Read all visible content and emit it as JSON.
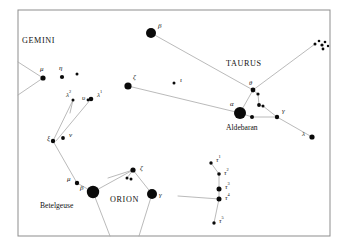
{
  "figure": {
    "kind": "star-chart",
    "background_color": "#ffffff",
    "frame_color": "#8d8d8d",
    "star_color": "#0a0a0a",
    "line_color": "#a8a8a8",
    "label_color": "#111111",
    "frame": {
      "x": 18,
      "y": 10,
      "width": 312,
      "height": 226
    }
  },
  "chart_data": {
    "type": "scatter",
    "title": "",
    "xlabel": "",
    "ylabel": "",
    "xlim": [
      0,
      343
    ],
    "ylim": [
      0,
      246
    ],
    "grid": false,
    "legend": "none",
    "constellation_names": [
      {
        "id": "gemini",
        "text": "GEMINI",
        "x": 22,
        "y": 43,
        "font_size": 8.2
      },
      {
        "id": "taurus",
        "text": "TAURUS",
        "x": 226,
        "y": 66,
        "font_size": 8.2
      },
      {
        "id": "orion",
        "text": "ORION",
        "x": 110,
        "y": 202,
        "font_size": 8.2
      }
    ],
    "proper_names": [
      {
        "id": "aldebaran",
        "text": "Aldebaran",
        "x": 226,
        "y": 130,
        "font_size": 7.6
      },
      {
        "id": "betelgeuse",
        "text": "Betelgeuse",
        "x": 40,
        "y": 208,
        "font_size": 7.6
      }
    ],
    "stars": [
      {
        "id": "beta-tau",
        "label": "β",
        "sup": "",
        "x": 151,
        "y": 33,
        "r": 5.0,
        "lx": 158,
        "ly": 28,
        "fs": 7.0
      },
      {
        "id": "zeta-tau",
        "label": "ζ",
        "sup": "",
        "x": 128,
        "y": 86,
        "r": 3.6,
        "lx": 133,
        "ly": 79,
        "fs": 7.0
      },
      {
        "id": "iota-tau",
        "label": "ι",
        "sup": "",
        "x": 174,
        "y": 83,
        "r": 1.5,
        "lx": 180,
        "ly": 82,
        "fs": 7.0
      },
      {
        "id": "alpha-tau",
        "label": "α",
        "sup": "",
        "x": 240,
        "y": 113,
        "r": 6.0,
        "lx": 230,
        "ly": 106,
        "fs": 7.0
      },
      {
        "id": "theta-tau",
        "label": "θ",
        "sup": "",
        "x": 253,
        "y": 90,
        "r": 2.4,
        "lx": 249,
        "ly": 85,
        "fs": 6.6
      },
      {
        "id": "theta2-tau",
        "label": "",
        "sup": "",
        "x": 258,
        "y": 94,
        "r": 1.6,
        "lx": 0,
        "ly": 0,
        "fs": 6.0
      },
      {
        "id": "delta-tau",
        "label": "",
        "sup": "",
        "x": 259,
        "y": 105,
        "r": 1.9,
        "lx": 0,
        "ly": 0,
        "fs": 6.0
      },
      {
        "id": "delta2-tau",
        "label": "",
        "sup": "",
        "x": 263,
        "y": 106,
        "r": 1.5,
        "lx": 0,
        "ly": 0,
        "fs": 6.0
      },
      {
        "id": "eps-tau",
        "label": "",
        "sup": "",
        "x": 252,
        "y": 117,
        "r": 2.0,
        "lx": 0,
        "ly": 0,
        "fs": 6.0
      },
      {
        "id": "gamma-tau",
        "label": "γ",
        "sup": "",
        "x": 277,
        "y": 117,
        "r": 2.2,
        "lx": 282,
        "ly": 113,
        "fs": 7.0
      },
      {
        "id": "lambda-tau",
        "label": "λ",
        "sup": "",
        "x": 312,
        "y": 137,
        "r": 2.6,
        "lx": 302,
        "ly": 136,
        "fs": 7.0
      },
      {
        "id": "pleiades-1",
        "label": "",
        "sup": "",
        "x": 315,
        "y": 44,
        "r": 1.5,
        "lx": 0,
        "ly": 0,
        "fs": 6.0
      },
      {
        "id": "pleiades-2",
        "label": "",
        "sup": "",
        "x": 319,
        "y": 41,
        "r": 1.3,
        "lx": 0,
        "ly": 0,
        "fs": 6.0
      },
      {
        "id": "pleiades-3",
        "label": "",
        "sup": "",
        "x": 322,
        "y": 45,
        "r": 1.6,
        "lx": 0,
        "ly": 0,
        "fs": 6.0
      },
      {
        "id": "pleiades-4",
        "label": "",
        "sup": "",
        "x": 325,
        "y": 42,
        "r": 1.3,
        "lx": 0,
        "ly": 0,
        "fs": 6.0
      },
      {
        "id": "pleiades-5",
        "label": "",
        "sup": "",
        "x": 323,
        "y": 49,
        "r": 1.4,
        "lx": 0,
        "ly": 0,
        "fs": 6.0
      },
      {
        "id": "pleiades-6",
        "label": "",
        "sup": "",
        "x": 328,
        "y": 46,
        "r": 1.2,
        "lx": 0,
        "ly": 0,
        "fs": 6.0
      },
      {
        "id": "mu-gem",
        "label": "μ",
        "sup": "",
        "x": 43,
        "y": 78,
        "r": 2.6,
        "lx": 40,
        "ly": 71,
        "fs": 7.0
      },
      {
        "id": "eta-gem",
        "label": "η",
        "sup": "",
        "x": 62,
        "y": 77,
        "r": 2.1,
        "lx": 59,
        "ly": 70,
        "fs": 7.0
      },
      {
        "id": "nu-gem",
        "label": "",
        "sup": "",
        "x": 77,
        "y": 74,
        "r": 1.5,
        "lx": 0,
        "ly": 0,
        "fs": 6.0
      },
      {
        "id": "lambda2-ori",
        "label": "λ",
        "sup": "2",
        "x": 73,
        "y": 100,
        "r": 1.5,
        "lx": 66,
        "ly": 97,
        "fs": 7.0
      },
      {
        "id": "ups-ori",
        "label": "υ",
        "sup": "",
        "x": 88,
        "y": 100,
        "r": 1.4,
        "lx": 82,
        "ly": 100,
        "fs": 7.0
      },
      {
        "id": "lambda1-ori",
        "label": "λ",
        "sup": "1",
        "x": 91,
        "y": 99,
        "r": 2.3,
        "lx": 97,
        "ly": 97,
        "fs": 7.0
      },
      {
        "id": "xi-ori",
        "label": "ξ",
        "sup": "",
        "x": 53,
        "y": 141,
        "r": 2.2,
        "lx": 47,
        "ly": 140,
        "fs": 7.0
      },
      {
        "id": "nu-ori",
        "label": "ν",
        "sup": "",
        "x": 63,
        "y": 138,
        "r": 1.9,
        "lx": 69,
        "ly": 137,
        "fs": 7.0
      },
      {
        "id": "mu-ori",
        "label": "μ",
        "sup": "",
        "x": 77,
        "y": 183,
        "r": 2.2,
        "lx": 67,
        "ly": 181,
        "fs": 7.0
      },
      {
        "id": "alpha-ori",
        "label": "β",
        "sup": "",
        "x": 93,
        "y": 192,
        "r": 6.2,
        "lx": 80,
        "ly": 190,
        "fs": 7.0
      },
      {
        "id": "chi-ori",
        "label": "ζ",
        "sup": "",
        "x": 133,
        "y": 170,
        "r": 2.6,
        "lx": 140,
        "ly": 170,
        "fs": 7.0
      },
      {
        "id": "chi2-ori",
        "label": "",
        "sup": "",
        "x": 127,
        "y": 178,
        "r": 1.5,
        "lx": 0,
        "ly": 0,
        "fs": 6.0
      },
      {
        "id": "chi3-ori",
        "label": "",
        "sup": "",
        "x": 131,
        "y": 179,
        "r": 1.5,
        "lx": 0,
        "ly": 0,
        "fs": 6.0
      },
      {
        "id": "gamma-ori",
        "label": "γ",
        "sup": "",
        "x": 152,
        "y": 194,
        "r": 5.0,
        "lx": 159,
        "ly": 197,
        "fs": 7.0
      },
      {
        "id": "tau1",
        "label": "τ",
        "sup": "1",
        "x": 211,
        "y": 163,
        "r": 1.7,
        "lx": 216,
        "ly": 162,
        "fs": 7.0
      },
      {
        "id": "tau2",
        "label": "τ",
        "sup": "2",
        "x": 219,
        "y": 174,
        "r": 1.8,
        "lx": 224,
        "ly": 175,
        "fs": 7.0
      },
      {
        "id": "tau3",
        "label": "τ",
        "sup": "3",
        "x": 219,
        "y": 189,
        "r": 2.5,
        "lx": 225,
        "ly": 189,
        "fs": 7.0
      },
      {
        "id": "tau4",
        "label": "τ",
        "sup": "4",
        "x": 219,
        "y": 199,
        "r": 2.5,
        "lx": 225,
        "ly": 200,
        "fs": 7.0
      },
      {
        "id": "tau5",
        "label": "τ",
        "sup": "5",
        "x": 214,
        "y": 223,
        "r": 1.7,
        "lx": 219,
        "ly": 223,
        "fs": 7.0
      }
    ],
    "lines": [
      {
        "id": "beta-to-theta",
        "points": "151,33 253,90"
      },
      {
        "id": "zeta-to-alpha",
        "points": "128,86 240,113"
      },
      {
        "id": "theta-to-alpha",
        "points": "253,90 240,113"
      },
      {
        "id": "theta-to-pleiades",
        "points": "253,90 315,44"
      },
      {
        "id": "theta2-chain",
        "points": "253,90 258,94 259,105 263,106"
      },
      {
        "id": "alpha-to-eps",
        "points": "240,113 252,117"
      },
      {
        "id": "eps-to-gamma",
        "points": "252,117 277,117"
      },
      {
        "id": "gamma-to-lambda",
        "points": "277,117 312,137"
      },
      {
        "id": "delta-to-gamma",
        "points": "263,106 277,117"
      },
      {
        "id": "gemini-left-upper",
        "points": "18,62 43,78"
      },
      {
        "id": "gemini-left-lower",
        "points": "18,95 43,78"
      },
      {
        "id": "lambda2-to-xi",
        "points": "73,100 53,141"
      },
      {
        "id": "lambda1-to-xi",
        "points": "91,99 56,141"
      },
      {
        "id": "lambda2-down",
        "points": "73,100 70,113"
      },
      {
        "id": "xi-to-mu",
        "points": "53,141 77,183"
      },
      {
        "id": "mu-to-betelgeuse",
        "points": "77,183 93,192"
      },
      {
        "id": "betelgeuse-to-chi",
        "points": "93,192 133,170"
      },
      {
        "id": "chi-to-gamma",
        "points": "133,170 152,194"
      },
      {
        "id": "chi2-to-betelgeuse",
        "points": "127,178 133,170"
      },
      {
        "id": "betelgeuse-down",
        "points": "93,192 110,236"
      },
      {
        "id": "gamma-down",
        "points": "152,194 139,236"
      },
      {
        "id": "tau-chain",
        "points": "211,163 219,174 219,189 219,199 214,223"
      },
      {
        "id": "tau4-left-tick",
        "points": "178,196 219,199"
      },
      {
        "id": "chi-upper-left",
        "points": "133,170 108,178"
      }
    ]
  }
}
